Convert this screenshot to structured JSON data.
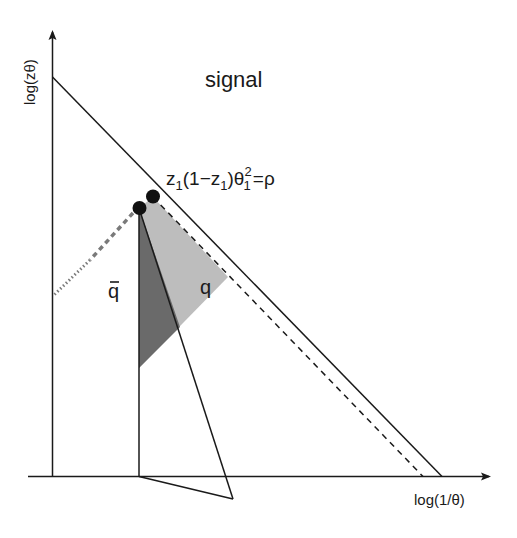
{
  "diagram": {
    "axes": {
      "y_label": "log(zθ)",
      "x_label": "log(1/θ)"
    },
    "region_label": "signal",
    "constraint_label": {
      "base": "z",
      "sub1": "1",
      "mid": "(1−z",
      "sub2": "1",
      "close": ")θ",
      "sup": "2",
      "sub3": "1",
      "rhs": "=ρ"
    },
    "regions": {
      "q_bar_label": "q",
      "q_label": "q"
    },
    "colors": {
      "line": "#1a1a1a",
      "dark_region": "#6a6a6a",
      "light_region": "#bdbdbd",
      "dashed_gray": "#7a7a7a"
    }
  }
}
